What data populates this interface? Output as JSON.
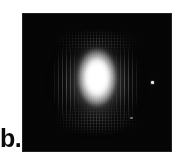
{
  "figure": {
    "panel_label": "b.",
    "caption_text": "",
    "background_color": "#ffffff"
  },
  "panel": {
    "name": "intensity-image",
    "type": "grayscale-intensity-image",
    "frame_color": "#050505",
    "background_color": "#050505",
    "x": 22,
    "y": 13,
    "width": 150,
    "height": 139
  },
  "chart_data": {
    "type": "heatmap",
    "title": "",
    "subtitle": "",
    "xlabel": "",
    "ylabel": "",
    "colormap": "grayscale",
    "colormap_low": "#000000",
    "colormap_high": "#ffffff",
    "grid": false,
    "legend": "none",
    "axis_ticks_visible": false,
    "features": [
      {
        "name": "beam-core",
        "shape": "vertical-ellipse",
        "center_x": 97,
        "center_y": 80,
        "width": 46,
        "height": 66,
        "peak_intensity": 255,
        "peak_color": "#ffffff"
      },
      {
        "name": "halo-mid",
        "shape": "vertical-ellipse",
        "center_x": 97,
        "center_y": 81,
        "width": 78,
        "height": 96,
        "peak_intensity": 150
      },
      {
        "name": "halo-outer",
        "shape": "vertical-ellipse",
        "center_x": 97,
        "center_y": 82,
        "width": 112,
        "height": 128,
        "peak_intensity": 70
      },
      {
        "name": "side-lobe-left",
        "shape": "vertical-stripes",
        "center_x": 67,
        "center_y": 82,
        "width": 26,
        "height": 78,
        "peak_intensity": 168
      },
      {
        "name": "side-lobe-right",
        "shape": "vertical-stripes",
        "center_x": 125,
        "center_y": 82,
        "width": 26,
        "height": 78,
        "peak_intensity": 168
      },
      {
        "name": "halo-band-top",
        "shape": "dithered-band",
        "center_x": 97,
        "center_y": 42,
        "width": 80,
        "height": 26,
        "peak_intensity": 150
      },
      {
        "name": "halo-band-bottom",
        "shape": "dithered-band",
        "center_x": 97,
        "center_y": 120,
        "width": 80,
        "height": 30,
        "peak_intensity": 150
      },
      {
        "name": "speck-right",
        "shape": "point",
        "center_x": 153,
        "center_y": 83,
        "width": 3,
        "height": 3,
        "peak_intensity": 232
      },
      {
        "name": "speck-lower",
        "shape": "point",
        "center_x": 131,
        "center_y": 118,
        "width": 3,
        "height": 2,
        "peak_intensity": 138
      }
    ]
  }
}
